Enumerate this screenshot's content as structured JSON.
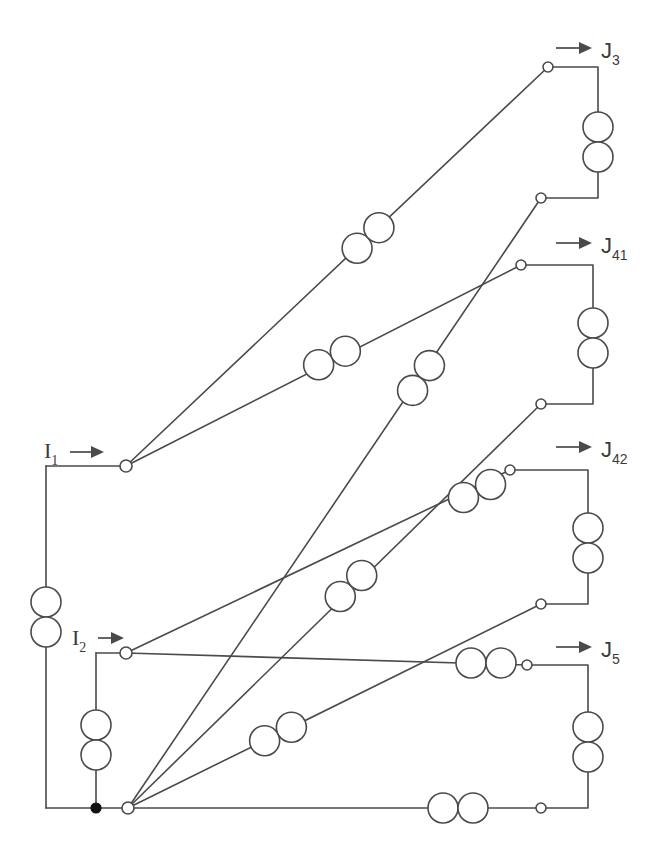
{
  "diagram": {
    "canvas": {
      "width": 656,
      "height": 867
    },
    "colors": {
      "background": "#ffffff",
      "wire": "#4a4a4a",
      "text": "#3b3b3b",
      "node_fill": "#ffffff",
      "junction_fill": "#111111"
    },
    "input_ports": [
      {
        "id": "I1",
        "base": "I",
        "subscript": "1",
        "label_x": 44,
        "label_y": 458,
        "arrow_x1": 70,
        "arrow_x2": 104,
        "arrow_y": 452
      },
      {
        "id": "I2",
        "base": "I",
        "subscript": "2",
        "label_x": 72,
        "label_y": 645,
        "arrow_x1": 98,
        "arrow_x2": 124,
        "arrow_y": 638
      }
    ],
    "output_ports": [
      {
        "id": "J3",
        "base": "J",
        "subscript": "3",
        "label_x": 601,
        "label_y": 58,
        "arrow_x1": 556,
        "arrow_x2": 592,
        "arrow_y": 48
      },
      {
        "id": "J41",
        "base": "J",
        "subscript": "41",
        "label_x": 601,
        "label_y": 253,
        "arrow_x1": 556,
        "arrow_x2": 592,
        "arrow_y": 243
      },
      {
        "id": "J42",
        "base": "J",
        "subscript": "42",
        "label_x": 601,
        "label_y": 457,
        "arrow_x1": 556,
        "arrow_x2": 592,
        "arrow_y": 447
      },
      {
        "id": "J5",
        "base": "J",
        "subscript": "5",
        "label_x": 601,
        "label_y": 657,
        "arrow_x1": 556,
        "arrow_x2": 592,
        "arrow_y": 647
      }
    ],
    "wires": [
      {
        "name": "wire-j3-loop",
        "points": "548,67 598,67 598,198 541,198"
      },
      {
        "name": "wire-j41-loop",
        "points": "521,265 593,265 593,404 541,404"
      },
      {
        "name": "wire-j42-loop",
        "points": "510,470 588,470 588,604 541,604"
      },
      {
        "name": "wire-j5-loop",
        "points": "527,665 588,665 588,808 541,808"
      },
      {
        "name": "wire-i1-in",
        "points": "46,466 126,466"
      },
      {
        "name": "wire-i1-left",
        "points": "46,466 46,590"
      },
      {
        "name": "wire-i1-left2",
        "points": "46,645 46,808"
      },
      {
        "name": "wire-bottom-left",
        "points": "46,808 128,808"
      },
      {
        "name": "wire-i2-in",
        "points": "96,653 126,653"
      },
      {
        "name": "wire-i2-down",
        "points": "96,653 96,713"
      },
      {
        "name": "wire-i2-down2",
        "points": "96,768 96,808"
      },
      {
        "name": "wire-bottom-main",
        "points": "128,808 541,808"
      },
      {
        "name": "wire-n1-j3",
        "points": "126,466 548,67"
      },
      {
        "name": "wire-n1-j41",
        "points": "126,466 521,265"
      },
      {
        "name": "wire-n2-j42",
        "points": "126,653 510,470"
      },
      {
        "name": "wire-n2-j5",
        "points": "126,653 527,665"
      },
      {
        "name": "wire-n3-j3b",
        "points": "128,808 541,198"
      },
      {
        "name": "wire-n3-j41b",
        "points": "128,808 541,404"
      },
      {
        "name": "wire-n3-j42b",
        "points": "128,808 541,604"
      }
    ],
    "couplers": [
      {
        "name": "coupler-j3-loop",
        "orientation": "vertical",
        "cx": 598,
        "cy": 142,
        "r": 15
      },
      {
        "name": "coupler-j41-loop",
        "orientation": "vertical",
        "cx": 593,
        "cy": 338,
        "r": 15
      },
      {
        "name": "coupler-j42-loop",
        "orientation": "vertical",
        "cx": 588,
        "cy": 543,
        "r": 15
      },
      {
        "name": "coupler-j5-loop",
        "orientation": "vertical",
        "cx": 588,
        "cy": 742,
        "r": 15
      },
      {
        "name": "coupler-i1-left",
        "orientation": "vertical",
        "cx": 46,
        "cy": 617,
        "r": 15
      },
      {
        "name": "coupler-i2-down",
        "orientation": "vertical",
        "cx": 96,
        "cy": 740,
        "r": 15
      },
      {
        "name": "coupler-bottom",
        "orientation": "horizontal",
        "cx": 458,
        "cy": 808,
        "r": 15
      },
      {
        "name": "coupler-n1-j3",
        "orientation": "diagonal",
        "cx": 368,
        "cy": 238,
        "r": 15,
        "angle": -43.4
      },
      {
        "name": "coupler-n1-j41",
        "orientation": "diagonal",
        "cx": 332,
        "cy": 358,
        "r": 15,
        "angle": -27.0
      },
      {
        "name": "coupler-n2-j42",
        "orientation": "diagonal",
        "cx": 477,
        "cy": 491,
        "r": 15,
        "angle": -25.5
      },
      {
        "name": "coupler-n2-j5",
        "orientation": "horizontal",
        "cx": 486,
        "cy": 663,
        "r": 15
      },
      {
        "name": "coupler-n3-j3b",
        "orientation": "diagonal",
        "cx": 421,
        "cy": 378,
        "r": 15,
        "angle": -55.9
      },
      {
        "name": "coupler-n3-j41b",
        "orientation": "diagonal",
        "cx": 351,
        "cy": 586,
        "r": 15,
        "angle": -44.3
      },
      {
        "name": "coupler-n3-j42b",
        "orientation": "diagonal",
        "cx": 278,
        "cy": 734,
        "r": 15,
        "angle": -26.9
      }
    ],
    "terminals": [
      {
        "name": "terminal-j3-top",
        "cx": 548,
        "cy": 67,
        "r": 5,
        "type": "open"
      },
      {
        "name": "terminal-j3-bottom",
        "cx": 541,
        "cy": 198,
        "r": 5,
        "type": "open"
      },
      {
        "name": "terminal-j41-top",
        "cx": 521,
        "cy": 265,
        "r": 5,
        "type": "open"
      },
      {
        "name": "terminal-j41-bottom",
        "cx": 541,
        "cy": 404,
        "r": 5,
        "type": "open"
      },
      {
        "name": "terminal-j42-top",
        "cx": 510,
        "cy": 470,
        "r": 5,
        "type": "open"
      },
      {
        "name": "terminal-j42-bottom",
        "cx": 541,
        "cy": 604,
        "r": 5,
        "type": "open"
      },
      {
        "name": "terminal-j5-top",
        "cx": 527,
        "cy": 665,
        "r": 5,
        "type": "open"
      },
      {
        "name": "terminal-j5-bottom",
        "cx": 541,
        "cy": 808,
        "r": 5,
        "type": "open"
      },
      {
        "name": "terminal-node-i1",
        "cx": 126,
        "cy": 466,
        "r": 6,
        "type": "open"
      },
      {
        "name": "terminal-node-i2",
        "cx": 126,
        "cy": 653,
        "r": 6,
        "type": "open"
      },
      {
        "name": "terminal-node-bottom",
        "cx": 128,
        "cy": 808,
        "r": 6,
        "type": "open"
      },
      {
        "name": "junction-dot-bottom",
        "cx": 96,
        "cy": 808,
        "r": 5,
        "type": "filled"
      }
    ]
  }
}
